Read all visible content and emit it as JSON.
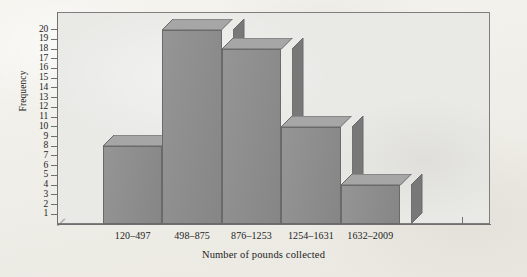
{
  "chart_data": {
    "type": "bar",
    "title": "",
    "subtitle": "",
    "xlabel": "Number of pounds collected",
    "ylabel": "Frequency",
    "categories": [
      "120–497",
      "498–875",
      "876–1253",
      "1254–1631",
      "1632–2009"
    ],
    "values": [
      8,
      20,
      18,
      10,
      4
    ],
    "ylim": [
      0,
      20
    ],
    "y_ticks": [
      1,
      2,
      3,
      4,
      5,
      6,
      7,
      8,
      9,
      10,
      11,
      12,
      13,
      14,
      15,
      16,
      17,
      18,
      19,
      20
    ],
    "y_tick_labels": [
      "1",
      "2",
      "3",
      "4",
      "5",
      "6",
      "7",
      "8",
      "9",
      "10",
      "11",
      "12",
      "13",
      "14",
      "15",
      "16",
      "17",
      "18",
      "19",
      "20"
    ],
    "grid": false,
    "legend": null,
    "legend_position": "none",
    "style": "3d-bars",
    "axis_break": "⁄⁄",
    "annotations": []
  },
  "figure": {
    "background_color": "#f2f1ec",
    "plot_background_color": "#e9e9e6",
    "frame_color": "#7e7e7e",
    "bar_front_color": "#8d8d8d",
    "bar_top_color": "#a6a6a6",
    "bar_side_color": "#787878",
    "bar_edge_color": "#6a6a6a",
    "axis_color": "#6f6f6f",
    "text_color": "#1d1d1d"
  }
}
